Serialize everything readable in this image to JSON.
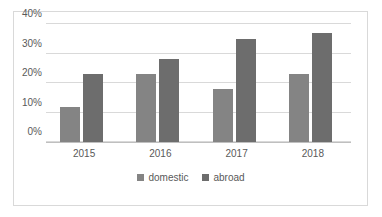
{
  "chart_data": {
    "type": "bar",
    "title": "",
    "subtitle": "",
    "xlabel": "",
    "ylabel": "",
    "categories": [
      "2015",
      "2016",
      "2017",
      "2018"
    ],
    "series": [
      {
        "name": "domestic",
        "values": [
          12,
          23,
          18,
          23
        ],
        "color": "#848484"
      },
      {
        "name": "abroad",
        "values": [
          23,
          28,
          35,
          37
        ],
        "color": "#6d6d6d"
      }
    ],
    "ylim": [
      0,
      40
    ],
    "y_ticks": [
      0,
      10,
      20,
      30,
      40
    ],
    "y_tick_labels": [
      "0%",
      "10%",
      "20%",
      "30%",
      "40%"
    ],
    "grid": true,
    "legend_position": "bottom",
    "unit": "%"
  },
  "legend": {
    "items": [
      {
        "label": "domestic",
        "color": "#848484"
      },
      {
        "label": "abroad",
        "color": "#6d6d6d"
      }
    ]
  },
  "colors": {
    "domestic": "#848484",
    "abroad": "#6d6d6d",
    "gridline": "#d9d9d9",
    "axis": "#bfbfbf",
    "border": "#d9d9d9",
    "text": "#595959",
    "background": "#ffffff"
  }
}
